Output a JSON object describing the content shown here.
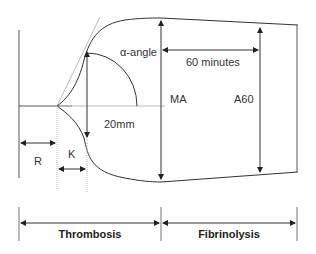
{
  "diagram": {
    "labels": {
      "alpha_angle": "α-angle",
      "sixty_minutes": "60 minutes",
      "ma": "MA",
      "a60": "A60",
      "twenty_mm": "20mm",
      "r": "R",
      "k": "K"
    },
    "phases": [
      {
        "label": "Thrombosis"
      },
      {
        "label": "Fibrinolysis"
      }
    ],
    "colors": {
      "line": "#444444",
      "tangent": "#aaaaaa",
      "text": "#333333"
    }
  }
}
